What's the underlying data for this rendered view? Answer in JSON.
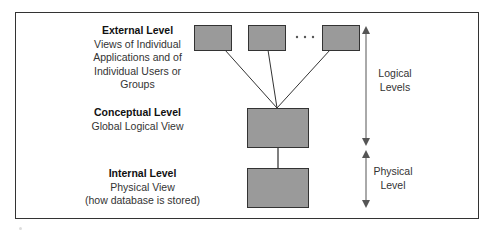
{
  "diagram": {
    "levels": [
      {
        "id": "external",
        "title": "External Level",
        "description_lines": [
          "Views of Individual",
          "Applications and of",
          "Individual Users or",
          "Groups"
        ]
      },
      {
        "id": "conceptual",
        "title": "Conceptual Level",
        "description_lines": [
          "Global Logical View"
        ]
      },
      {
        "id": "internal",
        "title": "Internal Level",
        "description_lines": [
          "Physical View",
          "(how database is stored)"
        ]
      }
    ],
    "ellipsis": "• • •",
    "side_labels": {
      "logical": [
        "Logical",
        "Levels"
      ],
      "physical": [
        "Physical",
        "Level"
      ]
    },
    "colors": {
      "box_fill": "#9a9a9a",
      "box_stroke": "#333333",
      "line": "#333333",
      "arrow": "#555555"
    }
  }
}
